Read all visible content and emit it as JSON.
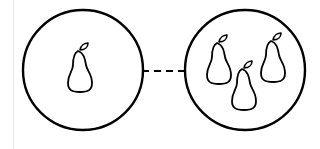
{
  "diagram": {
    "title": "",
    "colors": {
      "stroke": "#000000",
      "background": "#ffffff",
      "rule": "#e6e6e6"
    },
    "nodes": [
      {
        "id": "single-pear-group",
        "shape": "circle",
        "cx": 83,
        "cy": 70,
        "r": 60,
        "contents": [
          {
            "icon": "pear-icon",
            "count": 1
          }
        ]
      },
      {
        "id": "multiple-pear-group",
        "shape": "circle",
        "cx": 245,
        "cy": 70,
        "r": 60,
        "contents": [
          {
            "icon": "pear-icon",
            "count": 3
          }
        ]
      }
    ],
    "edges": [
      {
        "from": "single-pear-group",
        "to": "multiple-pear-group",
        "style": "dashed"
      }
    ]
  }
}
